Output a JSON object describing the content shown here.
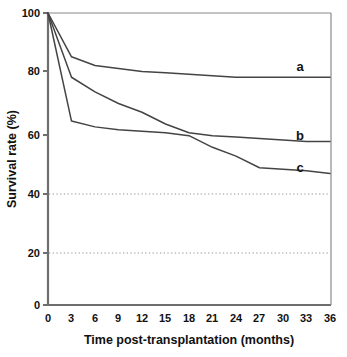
{
  "chart_data": {
    "type": "line",
    "title": "",
    "xlabel": "Time post-transplantation (months)",
    "ylabel": "Survival rate (%)",
    "xlim": [
      0,
      36
    ],
    "ylim": [
      0,
      100
    ],
    "xticks": [
      "0",
      "3",
      "6",
      "9",
      "12",
      "15",
      "18",
      "21",
      "24",
      "27",
      "30",
      "33",
      "36"
    ],
    "yticks": [
      "0",
      "20",
      "40",
      "60",
      "80",
      "100"
    ],
    "grid": "dotted horizontal reference lines at 40 and 20",
    "gridlines": [
      40,
      20
    ],
    "legend_position": "right-inline-labels",
    "x": [
      0,
      3,
      6,
      9,
      12,
      15,
      18,
      21,
      24,
      27,
      30,
      33,
      36
    ],
    "series": [
      {
        "name": "a",
        "label": "a",
        "color": "#444444",
        "values": [
          100,
          85,
          82,
          81,
          80,
          79.5,
          79,
          78.5,
          78,
          78,
          78,
          78,
          78
        ]
      },
      {
        "name": "b",
        "label": "b",
        "color": "#444444",
        "values": [
          100,
          78,
          73,
          69,
          66,
          62,
          59,
          58,
          57.5,
          57,
          56.5,
          56,
          56
        ]
      },
      {
        "name": "c",
        "label": "c",
        "color": "#444444",
        "values": [
          100,
          63,
          61,
          60,
          59.5,
          59,
          58,
          54,
          51,
          47,
          46.5,
          46,
          45
        ]
      }
    ]
  },
  "axis": {
    "y_title": "Survival rate (%)",
    "x_title": "Time post-transplantation (months)"
  },
  "colors": {
    "axis": "#6e6e6e",
    "curve": "#444444",
    "gridline": "#bdbdbd",
    "text": "#111111",
    "background": "#ffffff"
  }
}
